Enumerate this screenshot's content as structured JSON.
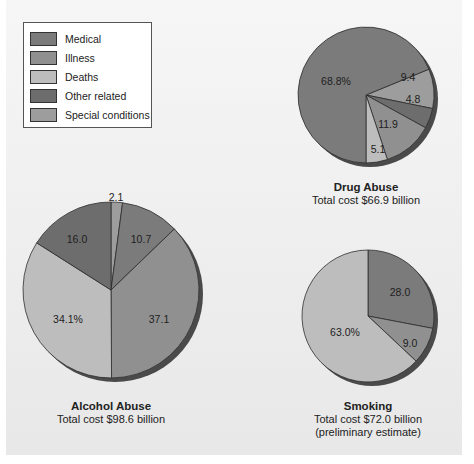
{
  "legend": {
    "items": [
      {
        "key": "medical",
        "label": "Medical",
        "color": "#7b7b7b"
      },
      {
        "key": "illness",
        "label": "Illness",
        "color": "#909090"
      },
      {
        "key": "deaths",
        "label": "Deaths",
        "color": "#bdbdbd"
      },
      {
        "key": "other",
        "label": "Other related",
        "color": "#6d6d6d"
      },
      {
        "key": "special",
        "label": "Special conditions",
        "color": "#9d9d9d"
      }
    ]
  },
  "colors": {
    "background": "#efefef",
    "outline": "#2e2e2e",
    "shadow": "#4a4a4a"
  },
  "captions": {
    "drug": {
      "title": "Drug Abuse",
      "lines": [
        "Total cost $66.9 billion"
      ]
    },
    "alcohol": {
      "title": "Alcohol Abuse",
      "lines": [
        "Total cost $98.6 billion"
      ]
    },
    "smoking": {
      "title": "Smoking",
      "lines": [
        "Total cost $72.0 billion",
        "(preliminary estimate)"
      ]
    }
  },
  "chart_data": [
    {
      "type": "pie",
      "title": "Drug Abuse",
      "subtitle": "Total cost $66.9 billion",
      "unit": "percent",
      "center": [
        366,
        95
      ],
      "radius": 68,
      "start_angle_deg": 67.68,
      "slices": [
        {
          "category": "Special conditions",
          "key": "special",
          "value": 9.4,
          "label": "9.4",
          "label_pos": [
            408,
            78
          ]
        },
        {
          "category": "Other related",
          "key": "other",
          "value": 4.8,
          "label": "4.8",
          "label_pos": [
            413,
            100
          ]
        },
        {
          "category": "Illness",
          "key": "illness",
          "value": 11.9,
          "label": "11.9",
          "label_pos": [
            388,
            125
          ]
        },
        {
          "category": "Deaths",
          "key": "deaths",
          "value": 5.1,
          "label": "5.1",
          "label_pos": [
            378,
            150
          ]
        },
        {
          "category": "Medical",
          "key": "medical",
          "value": 68.8,
          "label": "68.8%",
          "label_pos": [
            336,
            82
          ]
        }
      ]
    },
    {
      "type": "pie",
      "title": "Alcohol Abuse",
      "subtitle": "Total cost $98.6 billion",
      "unit": "percent",
      "center": [
        111,
        290
      ],
      "radius": 88,
      "start_angle_deg": 0,
      "slices": [
        {
          "category": "Special conditions",
          "key": "special",
          "value": 2.1,
          "label": "2.1",
          "label_pos": [
            116,
            198
          ]
        },
        {
          "category": "Medical",
          "key": "medical",
          "value": 10.7,
          "label": "10.7",
          "label_pos": [
            141,
            240
          ]
        },
        {
          "category": "Illness",
          "key": "illness",
          "value": 37.1,
          "label": "37.1",
          "label_pos": [
            159,
            320
          ]
        },
        {
          "category": "Deaths",
          "key": "deaths",
          "value": 34.1,
          "label": "34.1%",
          "label_pos": [
            68,
            320
          ]
        },
        {
          "category": "Other related",
          "key": "other",
          "value": 16.0,
          "label": "16.0",
          "label_pos": [
            77,
            240
          ]
        }
      ]
    },
    {
      "type": "pie",
      "title": "Smoking",
      "subtitle": "Total cost $72.0 billion (preliminary estimate)",
      "unit": "percent",
      "center": [
        368,
        316
      ],
      "radius": 66,
      "start_angle_deg": 0,
      "slices": [
        {
          "category": "Medical",
          "key": "medical",
          "value": 28.0,
          "label": "28.0",
          "label_pos": [
            400,
            293
          ]
        },
        {
          "category": "Illness",
          "key": "illness",
          "value": 9.0,
          "label": "9.0",
          "label_pos": [
            410,
            344
          ]
        },
        {
          "category": "Deaths",
          "key": "deaths",
          "value": 63.0,
          "label": "63.0%",
          "label_pos": [
            345,
            333
          ]
        }
      ]
    }
  ]
}
